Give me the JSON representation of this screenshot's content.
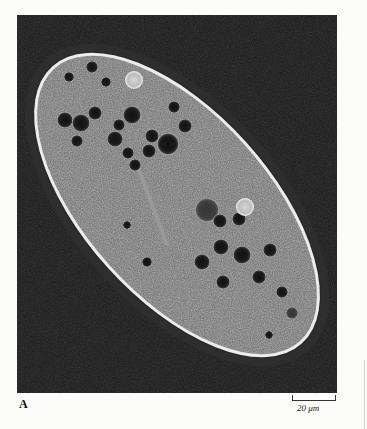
{
  "figure": {
    "panel_label": "A",
    "scale_bar_label": "20 μm",
    "colors": {
      "page_background": "#fbfbf9",
      "micrograph_background": "#141414",
      "cell_interior": "#7a7a7a",
      "cell_halo": "#e8e8e8"
    }
  }
}
